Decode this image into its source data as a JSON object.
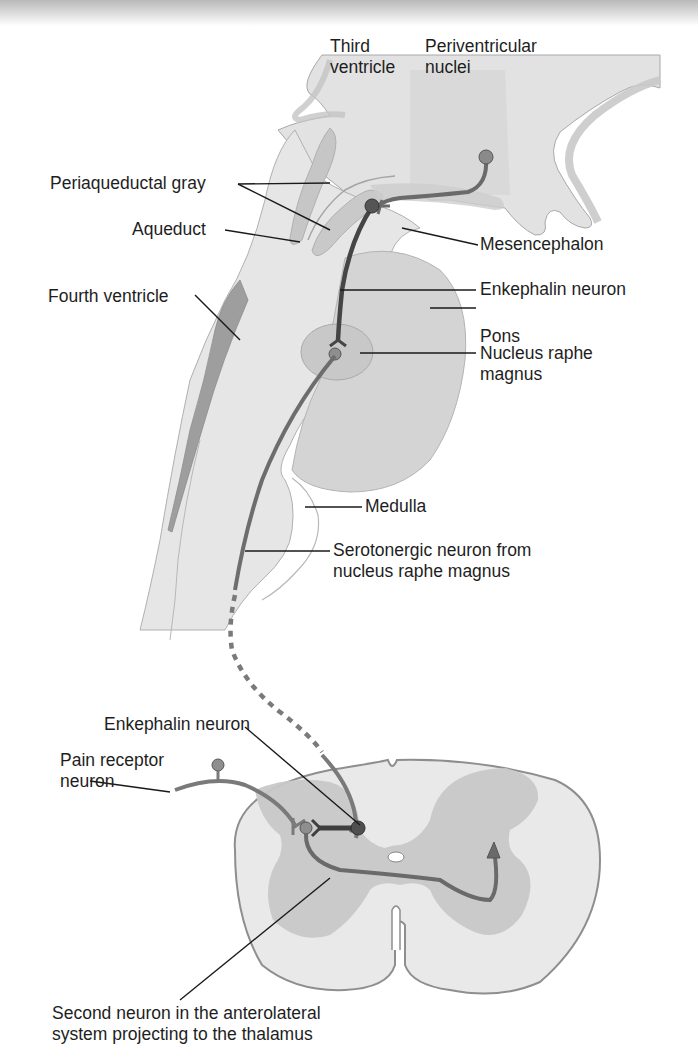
{
  "figure": {
    "colors": {
      "background": "#ffffff",
      "brain_tissue": "#e4e4e4",
      "brain_dark": "#d2d2d2",
      "pons": "#d6d6d6",
      "periaqueductal_gray": "#c4c4c4",
      "ventricle": "#9a9a9a",
      "spinal_white_matter": "#e8e8e8",
      "spinal_gray_matter": "#c6c6c6",
      "neuron": "#6d6d6d",
      "enkephalin_neuron": "#4a4a4a",
      "leader_line": "#1a1a1a"
    }
  },
  "labels": {
    "third_ventricle": "Third\nventricle",
    "periventricular_nuclei": "Periventricular\nnuclei",
    "periaqueductal_gray": "Periaqueductal gray",
    "aqueduct": "Aqueduct",
    "mesencephalon": "Mesencephalon",
    "enkephalin_neuron_brain": "Enkephalin neuron",
    "fourth_ventricle": "Fourth ventricle",
    "pons": "Pons",
    "nucleus_raphe_magnus": "Nucleus raphe\nmagnus",
    "medulla": "Medulla",
    "serotonergic_neuron": "Serotonergic neuron from\nnucleus raphe magnus",
    "enkephalin_neuron_spinal": "Enkephalin neuron",
    "pain_receptor_neuron": "Pain receptor\nneuron",
    "second_neuron": "Second neuron in the anterolateral\nsystem projecting to the thalamus"
  }
}
